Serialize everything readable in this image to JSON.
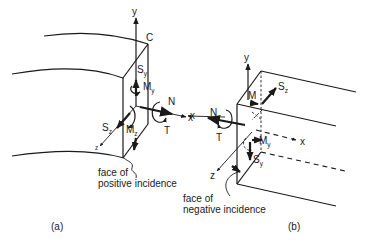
{
  "figure": {
    "panels": [
      {
        "id": "a",
        "caption": "(a)",
        "corner_label": "C",
        "axes": {
          "x": "x",
          "y": "y",
          "z": "z"
        },
        "forces": {
          "N": "N",
          "T": "T",
          "Sy": {
            "main": "S",
            "sub": "y"
          },
          "Sz": {
            "main": "S",
            "sub": "z"
          },
          "My": {
            "main": "M",
            "sub": "y"
          },
          "Mz": {
            "main": "M",
            "sub": "z"
          }
        },
        "annotation_line1": "face of",
        "annotation_line2": "positive incidence"
      },
      {
        "id": "b",
        "caption": "(b)",
        "axes": {
          "x": "x",
          "x2": "x",
          "y": "y",
          "z": "z"
        },
        "forces": {
          "N": "N",
          "T": "T",
          "Sy": {
            "main": "S",
            "sub": "y"
          },
          "Sz": {
            "main": "S",
            "sub": "z"
          },
          "My": {
            "main": "M",
            "sub": "y"
          },
          "Mz": {
            "main": "M",
            "sub": ""
          }
        },
        "annotation_line1": "face of",
        "annotation_line2": "negative incidence"
      }
    ]
  }
}
